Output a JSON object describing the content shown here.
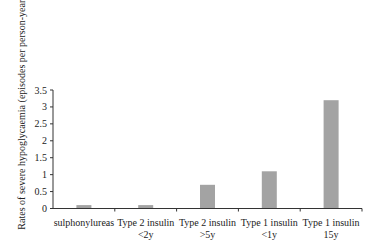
{
  "chart_data": {
    "type": "bar",
    "title": "",
    "xlabel": "",
    "ylabel": "Rates of severe hypoglycaemia (episodes per person-year)",
    "categories": [
      [
        "sulphonylureas"
      ],
      [
        "Type 2 insulin",
        "<2y"
      ],
      [
        "Type 2 insulin",
        ">5y"
      ],
      [
        "Type 1 insulin",
        "<1y"
      ],
      [
        "Type 1 insulin",
        "15y"
      ]
    ],
    "values": [
      0.1,
      0.1,
      0.7,
      1.1,
      3.2
    ],
    "ylim": [
      0,
      3.5
    ],
    "yticks": [
      0,
      0.5,
      1,
      1.5,
      2,
      2.5,
      3,
      3.5
    ],
    "ytick_labels": [
      "0",
      "0.5",
      "1",
      "1.5",
      "2",
      "2.5",
      "3",
      "3.5"
    ],
    "grid": false,
    "legend": null,
    "bar_color": "#a3a3a3",
    "axis_color": "#333333"
  }
}
